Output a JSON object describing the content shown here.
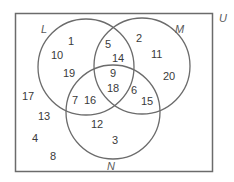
{
  "diagram": {
    "type": "venn",
    "universe_label": "U",
    "sets": [
      {
        "id": "L",
        "label": "L"
      },
      {
        "id": "M",
        "label": "M"
      },
      {
        "id": "N",
        "label": "N"
      }
    ],
    "regions": {
      "L_only": [
        "1",
        "10",
        "19"
      ],
      "M_only": [
        "2",
        "11",
        "20"
      ],
      "N_only": [
        "12",
        "3"
      ],
      "L_and_M_only": [
        "5",
        "14"
      ],
      "L_and_N_only": [
        "7",
        "16"
      ],
      "M_and_N_only": [
        "6",
        "15"
      ],
      "L_and_M_and_N": [
        "9",
        "18"
      ],
      "outside": [
        "17",
        "13",
        "4",
        "8"
      ]
    },
    "colors": {
      "stroke": "#6b6b6b",
      "text": "#3a3a3a",
      "label": "#5a5a5a",
      "background": "#ffffff"
    }
  }
}
